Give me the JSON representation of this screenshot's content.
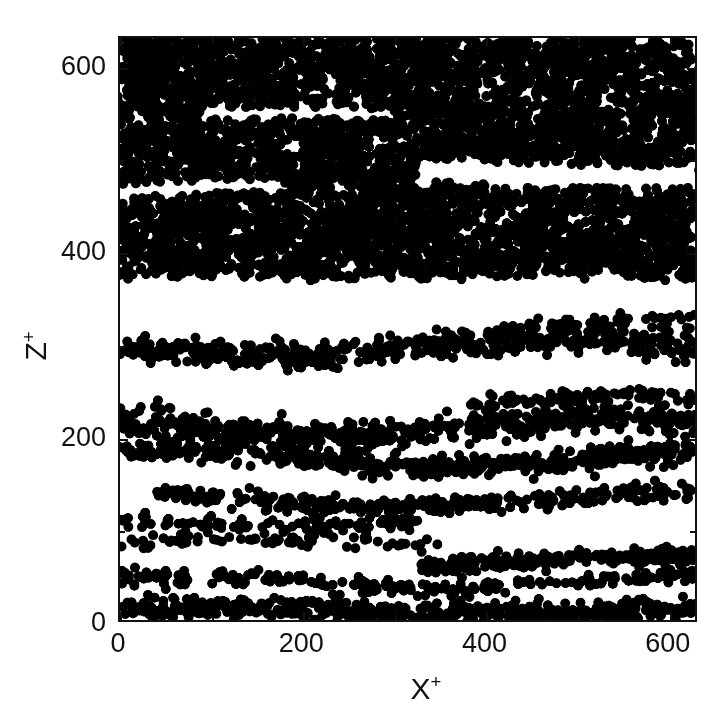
{
  "figure": {
    "background_color": "#ffffff",
    "ink_color": "#111111",
    "marker_color": "#000000"
  },
  "axes": {
    "x_title_base": "X",
    "x_title_sup": "+",
    "y_title_base": "Z",
    "y_title_sup": "+",
    "x_ticklabels": [
      "0",
      "200",
      "400",
      "600"
    ],
    "x_tickvalues": [
      0,
      200,
      400,
      600
    ],
    "y_ticklabels": [
      "0",
      "200",
      "400",
      "600"
    ],
    "y_tickvalues": [
      0,
      200,
      400,
      600
    ],
    "x_minor_tickvalues": [
      100,
      300,
      500
    ],
    "y_minor_tickvalues": [
      100,
      300,
      500
    ],
    "xlim": [
      0,
      632
    ],
    "ylim": [
      0,
      632
    ]
  },
  "chart_data": {
    "type": "scatter",
    "title": "",
    "subtitle": "",
    "xlabel": "X+",
    "ylabel": "Z+",
    "xlim": [
      0,
      632
    ],
    "ylim": [
      0,
      632
    ],
    "xticks": [
      0,
      200,
      400,
      600
    ],
    "yticks": [
      0,
      200,
      400,
      600
    ],
    "grid": false,
    "legend": null,
    "marker": "filled-circle",
    "marker_color": "#000000",
    "marker_diameter_units": 11,
    "n_points_approx": 4300,
    "streak_bands": [
      {
        "z_center": 10,
        "z_spread": 11,
        "density": 0.92,
        "x_start": 0,
        "x_end": 632,
        "wavy_amp": 4,
        "wavy_phase": 0.4,
        "label": "wall band Z+~10"
      },
      {
        "z_center": 42,
        "z_spread": 8,
        "density": 0.4,
        "x_start": 0,
        "x_end": 632,
        "wavy_amp": 7,
        "wavy_phase": 1.1,
        "label": "sparse band Z+~42"
      },
      {
        "z_center": 62,
        "z_spread": 9,
        "density": 0.78,
        "x_start": 330,
        "x_end": 632,
        "wavy_amp": 6,
        "wavy_phase": 2.0,
        "label": "right-side band Z+~62"
      },
      {
        "z_center": 82,
        "z_spread": 7,
        "density": 0.26,
        "x_start": 0,
        "x_end": 350,
        "wavy_amp": 5,
        "wavy_phase": 0.2,
        "label": "faint band Z+~82"
      },
      {
        "z_center": 108,
        "z_spread": 8,
        "density": 0.33,
        "x_start": 0,
        "x_end": 330,
        "wavy_amp": 6,
        "wavy_phase": 2.6,
        "label": "faint band Z+~108"
      },
      {
        "z_center": 130,
        "z_spread": 9,
        "density": 0.62,
        "x_start": 40,
        "x_end": 632,
        "wavy_amp": 8,
        "wavy_phase": 1.5,
        "label": "band Z+~130"
      },
      {
        "z_center": 176,
        "z_spread": 11,
        "density": 0.95,
        "x_start": 0,
        "x_end": 632,
        "wavy_amp": 9,
        "wavy_phase": 0.9,
        "label": "strong band Z+~176"
      },
      {
        "z_center": 210,
        "z_spread": 13,
        "density": 0.97,
        "x_start": 0,
        "x_end": 632,
        "wavy_amp": 10,
        "wavy_phase": 2.3,
        "label": "strong band Z+~210"
      },
      {
        "z_center": 236,
        "z_spread": 9,
        "density": 0.48,
        "x_start": 380,
        "x_end": 632,
        "wavy_amp": 7,
        "wavy_phase": 1.8,
        "label": "partial band Z+~236"
      },
      {
        "z_center": 296,
        "z_spread": 13,
        "density": 0.97,
        "x_start": 0,
        "x_end": 632,
        "wavy_amp": 9,
        "wavy_phase": 3.0,
        "label": "strong band Z+~296"
      },
      {
        "z_center": 322,
        "z_spread": 8,
        "density": 0.35,
        "x_start": 430,
        "x_end": 632,
        "wavy_amp": 6,
        "wavy_phase": 0.6,
        "label": "partial band Z+~322"
      }
    ],
    "saturated_region": {
      "z_min": 368,
      "z_max": 632,
      "x_min": 0,
      "x_max": 632,
      "density": 1.0,
      "internal_voids": [
        {
          "z_center": 487,
          "z_halfheight": 12,
          "x_start": 330,
          "x_end": 632,
          "label": "clear lane Z+~487"
        },
        {
          "z_center": 466,
          "z_halfheight": 7,
          "x_start": 0,
          "x_end": 180,
          "label": "clear lane Z+~466 left"
        },
        {
          "z_center": 545,
          "z_halfheight": 6,
          "x_start": 90,
          "x_end": 300,
          "label": "clear lane Z+~545"
        }
      ]
    }
  }
}
